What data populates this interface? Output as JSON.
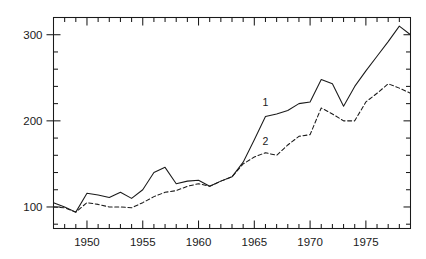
{
  "chart_data": {
    "type": "line",
    "title": "",
    "xlabel": "",
    "ylabel": "",
    "xlim": [
      1947,
      1979
    ],
    "ylim": [
      75,
      320
    ],
    "grid": false,
    "legend_position": "inline-annotations",
    "y_major_ticks": [
      100,
      200,
      300
    ],
    "y_major_tick_labels": [
      "100",
      "200",
      "300"
    ],
    "y_minor_tick_step": 20,
    "x_major_ticks": [
      1950,
      1955,
      1960,
      1965,
      1970,
      1975
    ],
    "x_major_tick_labels": [
      "1950",
      "1955",
      "1960",
      "1965",
      "1970",
      "1975"
    ],
    "x_minor_tick_step": 1,
    "x": [
      1947,
      1948,
      1949,
      1950,
      1951,
      1952,
      1953,
      1954,
      1955,
      1956,
      1957,
      1958,
      1959,
      1960,
      1961,
      1962,
      1963,
      1964,
      1965,
      1966,
      1967,
      1968,
      1969,
      1970,
      1971,
      1972,
      1973,
      1974,
      1975,
      1976,
      1977,
      1978,
      1979
    ],
    "series": [
      {
        "name": "1",
        "style": "solid",
        "color": "#1a1a1a",
        "annotation": "1",
        "annotation_x": 1966,
        "annotation_y": 217,
        "values": [
          105,
          100,
          94,
          116,
          114,
          111,
          117,
          110,
          120,
          140,
          146,
          127,
          130,
          131,
          124,
          130,
          135,
          152,
          178,
          205,
          208,
          212,
          220,
          222,
          248,
          243,
          217,
          240,
          258,
          275,
          292,
          310,
          300
        ]
      },
      {
        "name": "2",
        "style": "dashed",
        "color": "#1a1a1a",
        "annotation": "2",
        "annotation_x": 1966,
        "annotation_y": 172,
        "values": [
          100,
          99,
          94,
          105,
          103,
          100,
          100,
          99,
          105,
          112,
          117,
          119,
          124,
          127,
          124,
          130,
          135,
          150,
          158,
          163,
          160,
          172,
          182,
          184,
          215,
          208,
          200,
          200,
          222,
          232,
          243,
          238,
          232
        ]
      }
    ]
  }
}
